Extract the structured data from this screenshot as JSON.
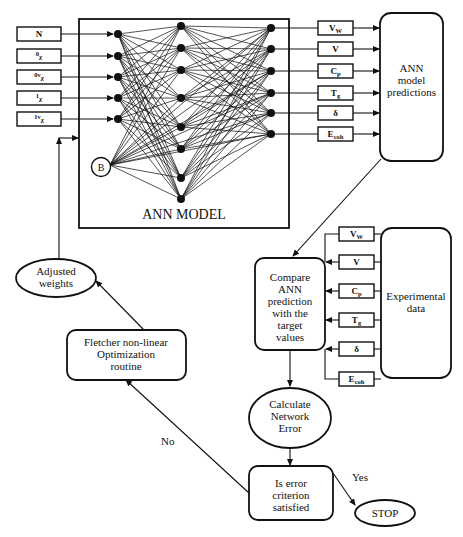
{
  "diagram": {
    "type": "flowchart",
    "ann_model": {
      "title": "ANN MODEL",
      "bias_label": "B",
      "input_layer_nodes": 5,
      "hidden_layer_nodes": 8,
      "output_layer_nodes": 6
    },
    "inputs": [
      {
        "base": "N",
        "sup": "",
        "sub": ""
      },
      {
        "base": "",
        "sup": "0",
        "sub": "χ"
      },
      {
        "base": "",
        "sup": "0v",
        "sub": "χ"
      },
      {
        "base": "",
        "sup": "1",
        "sub": "χ"
      },
      {
        "base": "",
        "sup": "1v",
        "sub": "χ"
      }
    ],
    "outputs": [
      {
        "base": "V",
        "sub": "W"
      },
      {
        "base": "V",
        "sub": ""
      },
      {
        "base": "C",
        "sub": "p"
      },
      {
        "base": "T",
        "sub": "g"
      },
      {
        "base": "δ",
        "sub": ""
      },
      {
        "base": "E",
        "sub": "coh"
      }
    ],
    "targets": [
      {
        "base": "V",
        "sub": "W"
      },
      {
        "base": "V",
        "sub": ""
      },
      {
        "base": "C",
        "sub": "p"
      },
      {
        "base": "T",
        "sub": "g"
      },
      {
        "base": "δ",
        "sub": ""
      },
      {
        "base": "E",
        "sub": "coh"
      }
    ],
    "nodes": {
      "predictions": [
        "ANN",
        "model",
        "predictions"
      ],
      "experimental": [
        "Experimental",
        "data"
      ],
      "compare": [
        "Compare",
        "ANN",
        "prediction",
        "with the",
        "target",
        "values"
      ],
      "calc_error": [
        "Calculate",
        "Network",
        "Error"
      ],
      "decision": [
        "Is error",
        "criterion",
        "satisfied"
      ],
      "optimizer": [
        "Fletcher non-linear",
        "Optimization",
        "routine"
      ],
      "adjusted_weights": [
        "Adjusted",
        "weights"
      ],
      "stop": "STOP"
    },
    "edge_labels": {
      "no": "No",
      "yes": "Yes"
    }
  }
}
